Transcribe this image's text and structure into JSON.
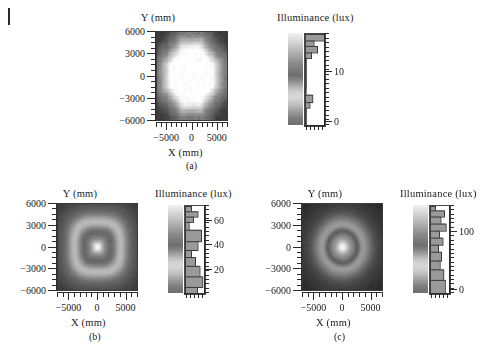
{
  "figure": {
    "edge_mark": "page-edge-rule",
    "axis_titles": {
      "y": "Y (mm)",
      "x": "X (mm)"
    },
    "colorbar_title": "Illuminance (lux)"
  },
  "panels": [
    {
      "id": "a",
      "caption": "(a)",
      "y_title": "Y (mm)",
      "x_title": "X (mm)",
      "colorbar_title": "Illuminance (lux)",
      "y_ticks": [
        "6000",
        "3000",
        "0",
        "-3000",
        "-6000"
      ],
      "x_ticks": [
        "-5000",
        "0",
        "5000"
      ],
      "cbar_ticks": [
        "10",
        "0"
      ]
    },
    {
      "id": "b",
      "caption": "(b)",
      "y_title": "Y (mm)",
      "x_title": "X (mm)",
      "colorbar_title": "Illuminance (lux)",
      "y_ticks": [
        "6000",
        "3000",
        "0",
        "-3000",
        "-6000"
      ],
      "x_ticks": [
        "-5000",
        "0",
        "5000"
      ],
      "cbar_ticks": [
        "60",
        "40",
        "20"
      ]
    },
    {
      "id": "c",
      "caption": "(c)",
      "y_title": "Y (mm)",
      "x_title": "X (mm)",
      "colorbar_title": "Illuminance (lux)",
      "y_ticks": [
        "6000",
        "3000",
        "0",
        "-3000",
        "-6000"
      ],
      "x_ticks": [
        "-5000",
        "0",
        "5000"
      ],
      "cbar_ticks": [
        "100",
        "0"
      ]
    }
  ],
  "chart_data": [
    {
      "type": "heatmap",
      "panel": "a",
      "title": "",
      "xlabel": "X (mm)",
      "ylabel": "Y (mm)",
      "cbar_label": "Illuminance (lux)",
      "xlim": [
        -7000,
        7000
      ],
      "ylim": [
        -7000,
        7000
      ],
      "xticks": [
        -5000,
        0,
        5000
      ],
      "yticks": [
        -6000,
        -3000,
        0,
        3000,
        6000
      ],
      "zlim": [
        0,
        16
      ],
      "cticks": [
        0,
        10
      ],
      "colormap": "gray",
      "grid": false,
      "pattern": "octagonal bright plateau centred on origin with dark square corners; coarse pixelation",
      "peak_value": 16,
      "background_value": 3,
      "nx": 28,
      "ny": 28
    },
    {
      "type": "heatmap",
      "panel": "b",
      "title": "",
      "xlabel": "X (mm)",
      "ylabel": "Y (mm)",
      "cbar_label": "Illuminance (lux)",
      "xlim": [
        -7000,
        7000
      ],
      "ylim": [
        -7000,
        7000
      ],
      "xticks": [
        -5000,
        0,
        5000
      ],
      "yticks": [
        -6000,
        -3000,
        0,
        3000,
        6000
      ],
      "zlim": [
        0,
        70
      ],
      "cticks": [
        20,
        40,
        60
      ],
      "colormap": "gray",
      "grid": false,
      "pattern": "bright rounded-square annulus with darker interior band and a bright core spot at the centre; dark outer corners",
      "peak_value": 70,
      "background_value": 12,
      "nx": 120,
      "ny": 120
    },
    {
      "type": "heatmap",
      "panel": "c",
      "title": "",
      "xlabel": "X (mm)",
      "ylabel": "Y (mm)",
      "cbar_label": "Illuminance (lux)",
      "xlim": [
        -7000,
        7000
      ],
      "ylim": [
        -7000,
        7000
      ],
      "xticks": [
        -5000,
        0,
        5000
      ],
      "yticks": [
        -6000,
        -3000,
        0,
        3000,
        6000
      ],
      "zlim": [
        0,
        120
      ],
      "cticks": [
        0,
        100
      ],
      "colormap": "gray",
      "grid": false,
      "pattern": "bright circular core at origin surrounded by a dark ring, then a brighter halo fading to dark corners",
      "peak_value": 120,
      "background_value": 15,
      "nx": 120,
      "ny": 120
    }
  ]
}
